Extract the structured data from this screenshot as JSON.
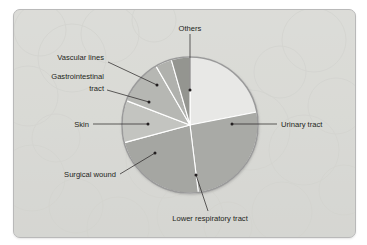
{
  "figure": {
    "title": "",
    "panel_background": "#d9dad6",
    "panel_border_color": "#b9b9b9"
  },
  "chart_data": {
    "type": "pie",
    "title": "",
    "xlabel": "",
    "ylabel": "",
    "legend_position": "none",
    "grid": false,
    "start_angle_deg": 0,
    "direction": "clockwise",
    "categories": [
      "Others",
      "Urinary tract",
      "Lower respiratory tract",
      "Surgical wound",
      "Skin",
      "Gastrointestinal tract",
      "Vascular lines"
    ],
    "values": [
      22,
      26,
      23,
      10,
      11,
      4,
      4
    ],
    "units": "percent",
    "colors": [
      "#e8e8e6",
      "#a9aaa6",
      "#a5a6a2",
      "#c3c4c0",
      "#b6b7b3",
      "#b0b1ad",
      "#949590"
    ],
    "slices": [
      {
        "label": "Others",
        "value": 22,
        "color": "#e8e8e6",
        "start_deg": 0,
        "end_deg": 79
      },
      {
        "label": "Urinary tract",
        "value": 26,
        "color": "#a9aaa6",
        "start_deg": 79,
        "end_deg": 173
      },
      {
        "label": "Lower respiratory tract",
        "value": 23,
        "color": "#a5a6a2",
        "start_deg": 173,
        "end_deg": 255
      },
      {
        "label": "Surgical wound",
        "value": 10,
        "color": "#c3c4c0",
        "start_deg": 255,
        "end_deg": 291
      },
      {
        "label": "Skin",
        "value": 11,
        "color": "#b6b7b3",
        "start_deg": 291,
        "end_deg": 330
      },
      {
        "label": "Gastrointestinal tract",
        "value": 4,
        "color": "#b0b1ad",
        "start_deg": 330,
        "end_deg": 344
      },
      {
        "label": "Vascular lines",
        "value": 4,
        "color": "#949590",
        "start_deg": 344,
        "end_deg": 360
      }
    ]
  },
  "labels": {
    "others": "Others",
    "urinary_tract": "Urinary tract",
    "lower_respiratory_tract": "Lower respiratory tract",
    "surgical_wound": "Surgical wound",
    "skin": "Skin",
    "gastrointestinal_tract_line1": "Gastrointestinal",
    "gastrointestinal_tract_line2": "tract",
    "vascular_lines": "Vascular lines"
  }
}
